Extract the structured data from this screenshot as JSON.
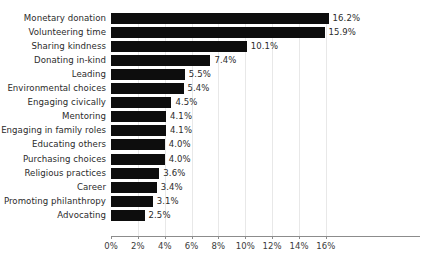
{
  "chart_data": {
    "type": "bar",
    "orientation": "horizontal",
    "title": "",
    "subtitle": "",
    "xlabel": "",
    "ylabel": "",
    "grid": true,
    "legend": null,
    "xlim": [
      0,
      16
    ],
    "xticks": [
      "0%",
      "2%",
      "4%",
      "6%",
      "8%",
      "10%",
      "12%",
      "14%",
      "16%"
    ],
    "xtick_values": [
      0,
      2,
      4,
      6,
      8,
      10,
      12,
      14,
      16
    ],
    "bar_color": "#0d0d0d",
    "grid_color": "#e8e8e8",
    "axis_color": "#8c8c8c",
    "text_color": "#2b2b2b",
    "categories": [
      "Monetary donation",
      "Volunteering time",
      "Sharing kindness",
      "Donating in-kind",
      "Leading",
      "Environmental choices",
      "Engaging civically",
      "Mentoring",
      "Engaging in family roles",
      "Educating others",
      "Purchasing choices",
      "Religious practices",
      "Career",
      "Promoting philanthropy",
      "Advocating"
    ],
    "values": [
      16.2,
      15.9,
      10.1,
      7.4,
      5.5,
      5.4,
      4.5,
      4.1,
      4.1,
      4.0,
      4.0,
      3.6,
      3.4,
      3.1,
      2.5
    ],
    "value_labels": [
      "16.2%",
      "15.9%",
      "10.1%",
      "7.4%",
      "5.5%",
      "5.4%",
      "4.5%",
      "4.1%",
      "4.1%",
      "4.0%",
      "4.0%",
      "3.6%",
      "3.4%",
      "3.1%",
      "2.5%"
    ]
  }
}
